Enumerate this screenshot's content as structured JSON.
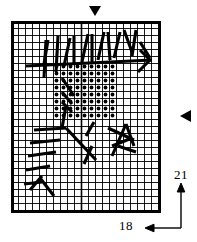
{
  "figure": {
    "type": "grid-character-diagram",
    "grid": {
      "columns": 21,
      "rows": 27,
      "cell_px": 7,
      "origin_x": 11,
      "origin_y": 21,
      "line_color": "#000000",
      "background": "#ffffff",
      "border_width": 3,
      "center_column_index": 10
    },
    "dot_region": {
      "label": "dotted-fill-area",
      "cols": 9,
      "rows": 8,
      "start_col": 6,
      "start_row": 6,
      "dot_color": "#000000",
      "dot_radius": 1.9
    },
    "strokes": {
      "label": "brush-stroke-overlay",
      "color": "#000000",
      "paths": [
        "M26,66 L152,60",
        "M44,64 L48,40",
        "M46,40 L44,78",
        "M58,36 L56,72",
        "M70,38 L64,66",
        "M74,36 L74,64",
        "M88,34 L82,62",
        "M92,34 L92,62",
        "M104,32 L98,60",
        "M108,32 L110,60",
        "M120,32 L114,58",
        "M124,30 L132,52",
        "M136,30 L132,56",
        "M140,42 L150,58",
        "M150,60 L138,72",
        "M150,60 L140,50",
        "M62,78 L74,96",
        "M62,92 L72,104",
        "M62,102 L72,112",
        "M34,130 L66,128",
        "M62,128 L66,106",
        "M30,143 L60,140",
        "M28,156 L56,152",
        "M26,170 L50,166",
        "M24,184 L42,182",
        "M30,190 L42,176",
        "M40,178 L54,196",
        "M66,128 L96,160",
        "M86,136 L94,122",
        "M92,146 L84,164",
        "M108,128 L134,140",
        "M112,156 L126,124",
        "M126,124 L134,146",
        "M132,138 L112,146",
        "M118,146 L136,152"
      ]
    },
    "markers": [
      {
        "name": "top-pointer",
        "glyph": "down-triangle",
        "x": 95,
        "y": 8,
        "size": 9
      },
      {
        "name": "right-pointer",
        "glyph": "left-triangle",
        "x": 183,
        "y": 116,
        "size": 9
      }
    ],
    "dimensions": [
      {
        "name": "height-dimension",
        "value": "21",
        "arrow": "up",
        "axis": "vertical"
      },
      {
        "name": "width-dimension",
        "value": "18",
        "arrow": "left",
        "axis": "horizontal"
      }
    ],
    "colors": {
      "ink": "#000000",
      "paper": "#ffffff",
      "grid_line": "#1a1a1a"
    }
  }
}
